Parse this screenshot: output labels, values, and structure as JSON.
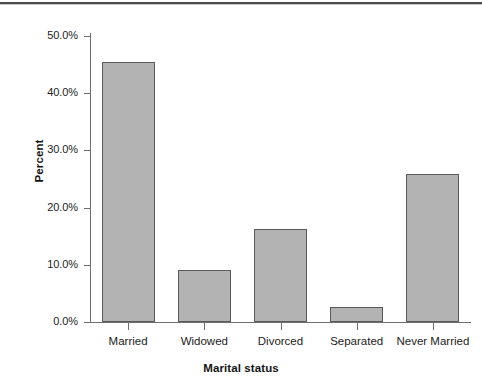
{
  "chart_data": {
    "type": "bar",
    "title": "",
    "subtitle": "",
    "categories": [
      "Married",
      "Widowed",
      "Divorced",
      "Separated",
      "Never Married"
    ],
    "values": [
      45.4,
      9.1,
      16.3,
      2.6,
      25.9
    ],
    "value_labels": [
      "45.4%",
      "9.1%",
      "16.3%",
      "2.6%",
      "25.9%"
    ],
    "series": [
      {
        "name": "Percent",
        "values": [
          45.4,
          9.1,
          16.3,
          2.6,
          25.9
        ]
      }
    ],
    "xlabel": "Marital status",
    "ylabel": "Percent",
    "ylim": [
      0,
      50
    ],
    "ytick_values": [
      0,
      10,
      20,
      30,
      40,
      50
    ],
    "ytick_labels": [
      "0.0%",
      "10.0%",
      "20.0%",
      "30.0%",
      "40.0%",
      "50.0%"
    ],
    "grid": false,
    "legend": false,
    "legend_position": "none",
    "bar_fill_color": "#b3b3b3",
    "bar_edge_color": "#5a5a5a",
    "axis_color": "#6e6e6e",
    "text_color": "#1c1c1c",
    "background_color": "#ffffff"
  }
}
